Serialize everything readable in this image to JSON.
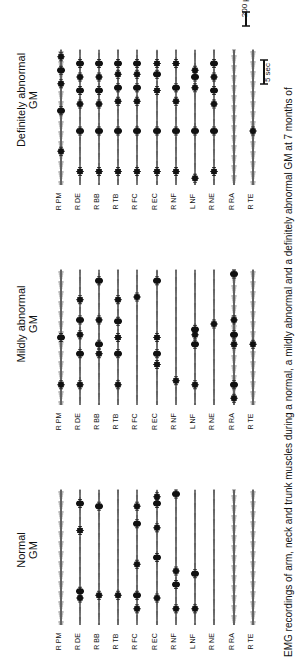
{
  "figure": {
    "caption": "EMG recordings of arm, neck and trunk muscles during a normal, a mildly abnormal and a definitely abnormal GM at 7 months of",
    "panels": [
      {
        "title_line1": "Definitely abnormal",
        "title_line2": "GM",
        "trace_top": 50,
        "trace_bottom": 185,
        "label_top": 190
      },
      {
        "title_line1": "Mildly abnormal",
        "title_line2": "GM",
        "trace_top": 270,
        "trace_bottom": 405,
        "label_top": 410
      },
      {
        "title_line1": "Normal",
        "title_line2": "GM",
        "trace_top": 490,
        "trace_bottom": 625,
        "label_top": 630
      }
    ],
    "muscles": [
      "R PM",
      "R DE",
      "R BB",
      "R TB",
      "R FC",
      "R EC",
      "R NF",
      "L NF",
      "R NE",
      "R RA",
      "R TE"
    ],
    "scale_bars": {
      "amplitude": "200 µV",
      "time": "5 sec"
    },
    "colors": {
      "trace": "#111111",
      "background": "#ffffff"
    }
  },
  "chart_data": {
    "type": "line",
    "channels": [
      "R PM",
      "R DE",
      "R BB",
      "R TB",
      "R FC",
      "R EC",
      "R NF",
      "L NF",
      "R NE",
      "R RA",
      "R TE"
    ],
    "conditions": [
      "Definitely abnormal GM",
      "Mildly abnormal GM",
      "Normal GM"
    ],
    "amplitude_scale": "200 µV",
    "time_scale": "5 sec",
    "burst_positions_relative": {
      "Definitely abnormal GM": {
        "R PM": [
          0.25,
          0.55,
          0.75,
          0.85,
          0.95
        ],
        "R DE": [
          0.1,
          0.4,
          0.6,
          0.7,
          0.8,
          0.9
        ],
        "R BB": [
          0.1,
          0.4,
          0.6,
          0.7,
          0.8,
          0.9
        ],
        "R TB": [
          0.1,
          0.4,
          0.62,
          0.72,
          0.82,
          0.9
        ],
        "R FC": [
          0.1,
          0.4,
          0.62,
          0.72,
          0.82,
          0.9
        ],
        "R EC": [
          0.1,
          0.4,
          0.7,
          0.82,
          0.9
        ],
        "R NF": [
          0.1,
          0.4,
          0.62,
          0.72,
          0.9
        ],
        "L NF": [
          0.05,
          0.4,
          0.72,
          0.8,
          0.85
        ],
        "R NE": [
          0.1,
          0.4,
          0.6,
          0.7,
          0.8,
          0.9
        ],
        "R RA": [],
        "R TE": [
          0.4
        ]
      },
      "Mildly abnormal GM": {
        "R PM": [
          0.15,
          0.5
        ],
        "R DE": [
          0.15,
          0.38,
          0.52,
          0.63,
          0.78
        ],
        "R BB": [
          0.38,
          0.45,
          0.63,
          0.92
        ],
        "R TB": [
          0.15,
          0.38,
          0.5,
          0.62,
          0.78
        ],
        "R FC": [
          0.8
        ],
        "R EC": [
          0.3,
          0.38,
          0.5,
          0.92
        ],
        "R NF": [
          0.18
        ],
        "L NF": [
          0.15,
          0.45,
          0.52,
          0.56
        ],
        "R NE": [
          0.6
        ],
        "R RA": [
          0.05,
          0.15,
          0.45,
          0.52,
          0.63,
          0.97
        ],
        "R TE": [
          0.45
        ]
      },
      "Normal GM": {
        "R PM": [],
        "R DE": [
          0.2,
          0.25,
          0.7,
          0.9
        ],
        "R BB": [
          0.22,
          0.88
        ],
        "R TB": [
          0.22
        ],
        "R FC": [
          0.12,
          0.22,
          0.45,
          0.75,
          0.88
        ],
        "R EC": [
          0.2,
          0.5,
          0.72,
          0.9,
          0.95
        ],
        "R NF": [
          0.12,
          0.3,
          0.4,
          0.97
        ],
        "L NF": [
          0.12,
          0.38
        ],
        "R NE": [],
        "R RA": [],
        "R TE": []
      }
    }
  }
}
